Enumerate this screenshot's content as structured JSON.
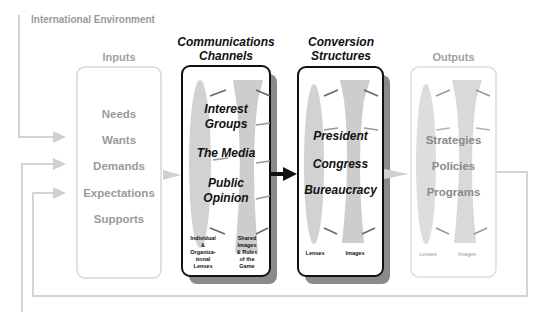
{
  "environment_label": "International Environment",
  "inputs": {
    "title": "Inputs",
    "items": [
      "Needs",
      "Wants",
      "Demands",
      "Expectations",
      "Supports"
    ]
  },
  "communications": {
    "title_line1": "Communications",
    "title_line2": "Channels",
    "items": [
      {
        "line1": "Interest",
        "line2": "Groups"
      },
      {
        "line1": "The Media",
        "line2": ""
      },
      {
        "line1": "Public",
        "line2": "Opinion"
      }
    ],
    "lens_label": [
      "Individual",
      "&",
      "Organiza-",
      "tional",
      "Lenses"
    ],
    "image_label": [
      "Shared",
      "Images",
      "& Rules",
      "of the",
      "Game"
    ]
  },
  "conversion": {
    "title_line1": "Conversion",
    "title_line2": "Structures",
    "items": [
      "President",
      "Congress",
      "Bureaucracy"
    ],
    "lens_label": "Lenses",
    "image_label": "Images"
  },
  "outputs": {
    "title": "Outputs",
    "items": [
      "Strategies",
      "Policies",
      "Programs"
    ],
    "lens_label": "Lenses",
    "image_label": "Images"
  },
  "colors": {
    "flow_line": "#d4d4d4",
    "light_box_border": "#d8d8d8",
    "dark_box_border": "#111111",
    "shadow": "#8a8a8a",
    "lens_fill": "#cfcfcf",
    "gray_text": "#9a9a9a"
  }
}
